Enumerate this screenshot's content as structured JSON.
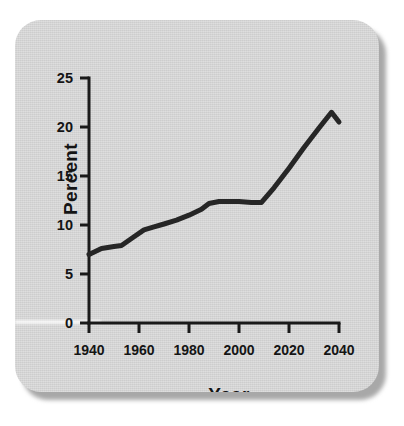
{
  "figure": {
    "card_background": "#d4d4d4",
    "page_background": "#ffffff",
    "line_color": "#262626",
    "axis_color": "#1a1a1a"
  },
  "chart_data": {
    "type": "line",
    "title": "",
    "subtitle": "",
    "xlabel": "Year",
    "ylabel": "Percent",
    "xlim": [
      1940,
      2040
    ],
    "ylim": [
      0,
      25
    ],
    "xticks": [
      1940,
      1960,
      1980,
      2000,
      2020,
      2040
    ],
    "xtick_labels": [
      "1940",
      "1960",
      "1980",
      "2000",
      "2020",
      "2040"
    ],
    "yticks": [
      0,
      5,
      10,
      15,
      20,
      25
    ],
    "ytick_labels": [
      "0",
      "5",
      "10",
      "15",
      "20",
      "25"
    ],
    "grid": false,
    "legend": false,
    "legend_position": "none",
    "annotations": [],
    "series": [
      {
        "name": "Percent",
        "color": "#262626",
        "line_width": 5,
        "x": [
          1940,
          1945,
          1950,
          1953,
          1958,
          1962,
          1966,
          1970,
          1975,
          1980,
          1985,
          1988,
          1992,
          1996,
          2000,
          2005,
          2009,
          2014,
          2020,
          2026,
          2032,
          2037,
          2040
        ],
        "values": [
          7.0,
          7.6,
          7.8,
          7.9,
          8.8,
          9.5,
          9.8,
          10.1,
          10.5,
          11.0,
          11.6,
          12.2,
          12.4,
          12.4,
          12.4,
          12.3,
          12.3,
          13.8,
          15.8,
          17.9,
          19.9,
          21.5,
          20.5
        ]
      }
    ]
  }
}
